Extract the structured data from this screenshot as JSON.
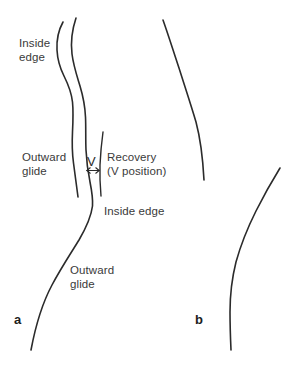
{
  "figure": {
    "panels": [
      {
        "id": "a",
        "letter": "a"
      },
      {
        "id": "b",
        "letter": "b"
      }
    ],
    "labels": {
      "inside_edge_top_line1": "Inside",
      "inside_edge_top_line2": "edge",
      "outward_glide_upper_line1": "Outward",
      "outward_glide_upper_line2": "glide",
      "recovery_line1": "Recovery",
      "recovery_line2": "(V position)",
      "inside_edge_mid": "Inside edge",
      "outward_glide_lower_line1": "Outward",
      "outward_glide_lower_line2": "glide",
      "v_marker": "V"
    },
    "colors": {
      "background": "#ffffff",
      "stroke": "#2b2b2b",
      "text": "#3a3a3a",
      "panel_letter": "#1d1d1d"
    }
  }
}
